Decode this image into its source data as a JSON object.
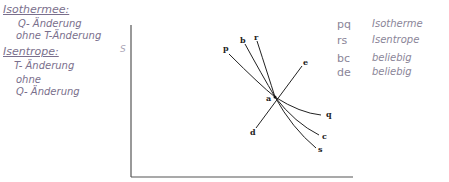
{
  "notes_left": {
    "isotherme_title": "Isothermee:",
    "isotherme_line1": "Q- Änderung",
    "isotherme_line2": "ohne T-Änderung",
    "isentrope_title": "Isentrope:",
    "isentrope_line1": "T- Änderung",
    "isentrope_line2": "ohne",
    "isentrope_line3": "Q- Änderung"
  },
  "legend": [
    {
      "code": "pq",
      "desc": "Isotherme"
    },
    {
      "code": "rs",
      "desc": "Isentrope"
    },
    {
      "code": "bc",
      "desc": "beliebig"
    },
    {
      "code": "de",
      "desc": "beliebig"
    }
  ],
  "diagram": {
    "y_axis_label": "S",
    "point_labels": {
      "p": "p",
      "b": "b",
      "r": "r",
      "e": "e",
      "a": "a",
      "d": "d",
      "q": "q",
      "c": "c",
      "s": "s"
    },
    "colors": {
      "lines": "#222222",
      "handwriting": "#7a6f8c"
    }
  }
}
